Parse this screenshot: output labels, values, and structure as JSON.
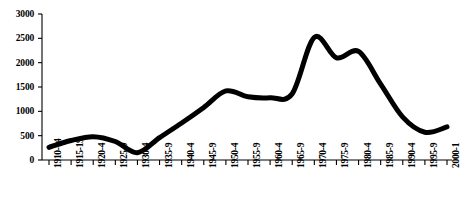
{
  "chart_data": {
    "type": "line",
    "title": "",
    "subtitle": "",
    "xlabel": "",
    "ylabel": "",
    "grid": false,
    "legend": null,
    "legend_position": "none",
    "line_color": "#000000",
    "line_width_px": 5,
    "axis_color": "#000000",
    "xlim_categories": 19,
    "ylim": [
      0,
      3000
    ],
    "ytick_step": 500,
    "yticks": [
      0,
      500,
      1000,
      1500,
      2000,
      2500,
      3000
    ],
    "ytick_labels": [
      "0",
      "500",
      "1000",
      "1500",
      "2000",
      "2500",
      "3000"
    ],
    "categories": [
      "1910-14",
      "1915-19",
      "1920-4",
      "1925-9",
      "1930-4",
      "1935-9",
      "1940-4",
      "1945-9",
      "1950-4",
      "1955-9",
      "1960-4",
      "1965-9",
      "1970-4",
      "1975-9",
      "1980-4",
      "1985-9",
      "1990-4",
      "1995-9",
      "2000-1"
    ],
    "values": [
      260,
      400,
      480,
      380,
      150,
      460,
      760,
      1080,
      1420,
      1300,
      1280,
      1360,
      2520,
      2100,
      2230,
      1560,
      880,
      570,
      680
    ],
    "annotations": []
  }
}
